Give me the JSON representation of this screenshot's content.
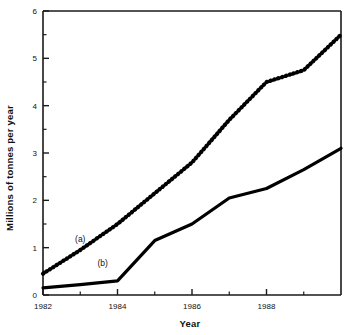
{
  "chart_data": {
    "type": "line",
    "title": "",
    "xlabel": "Year",
    "ylabel": "Millions of tonnes per year",
    "xlim": [
      1982,
      1990
    ],
    "ylim": [
      0,
      6
    ],
    "grid": false,
    "legend_position": "inline-annotations",
    "x_major_ticks": [
      1982,
      1984,
      1986,
      1988
    ],
    "x_major_tick_labels": [
      "1982",
      "1984",
      "1986",
      "1988"
    ],
    "x_minor_ticks": [
      1983,
      1985,
      1987,
      1989
    ],
    "y_major_ticks": [
      0,
      1,
      2,
      3,
      4,
      5,
      6
    ],
    "y_major_tick_labels": [
      "0",
      "1",
      "2",
      "3",
      "4",
      "5",
      "6"
    ],
    "y_minor_ticks": [
      0.5,
      1.5,
      2.5,
      3.5,
      4.5,
      5.5
    ],
    "x": [
      1982,
      1983,
      1984,
      1985,
      1986,
      1987,
      1988,
      1989,
      1990
    ],
    "series": [
      {
        "name": "(a)",
        "style": "dotted",
        "color": "#000000",
        "annotation": "(a)",
        "annotation_x": 1983.0,
        "annotation_y": 1.12,
        "values": [
          0.45,
          0.95,
          1.5,
          2.15,
          2.8,
          3.7,
          4.5,
          4.75,
          5.5
        ]
      },
      {
        "name": "(b)",
        "style": "solid",
        "color": "#000000",
        "annotation": "(b)",
        "annotation_x": 1983.6,
        "annotation_y": 0.62,
        "values": [
          0.15,
          0.22,
          0.3,
          1.15,
          1.5,
          2.05,
          2.25,
          2.65,
          3.1
        ]
      }
    ]
  }
}
